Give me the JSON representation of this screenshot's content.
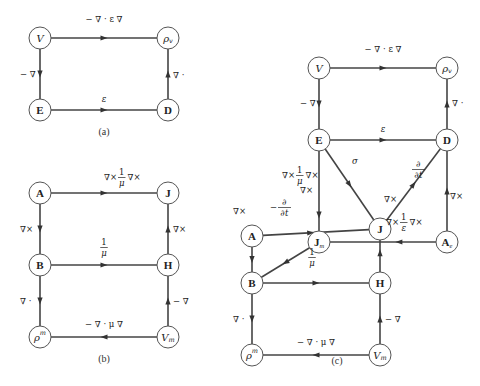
{
  "diagrams": {
    "a": {
      "caption": "(a)",
      "nodes": {
        "V": {
          "label": "V",
          "style": "ital"
        },
        "rho_v": {
          "label": "ρ",
          "sub": "v",
          "style": "ital"
        },
        "E": {
          "label": "E",
          "style": "bold"
        },
        "D": {
          "label": "D",
          "style": "bold"
        }
      },
      "edges": {
        "V_rho": "− ∇ · ε ∇",
        "V_E": "− ∇",
        "E_D": "ε",
        "D_rho": "∇ ·"
      }
    },
    "b": {
      "caption": "(b)",
      "nodes": {
        "A": {
          "label": "A",
          "style": "bold"
        },
        "J": {
          "label": "J",
          "style": "bold"
        },
        "B": {
          "label": "B",
          "style": "bold"
        },
        "H": {
          "label": "H",
          "style": "bold"
        },
        "rho_m": {
          "label": "ρ",
          "sup": "m",
          "style": "ital"
        },
        "V_m": {
          "label": "V",
          "sub": "m",
          "style": "ital"
        }
      },
      "edges": {
        "A_J": {
          "pre": "∇×",
          "num": "1",
          "den": "μ",
          "post": "∇×"
        },
        "A_B": "∇×",
        "B_H": {
          "num": "1",
          "den": "μ"
        },
        "H_J": "∇×",
        "B_rho": "∇ ·",
        "Vm_H": "− ∇",
        "Vm_rho": "− ∇ · μ ∇"
      }
    },
    "c": {
      "caption": "(c)",
      "nodes": {
        "V": {
          "label": "V",
          "style": "ital"
        },
        "rho_v": {
          "label": "ρ",
          "sub": "v",
          "style": "ital"
        },
        "E": {
          "label": "E",
          "style": "bold"
        },
        "D": {
          "label": "D",
          "style": "bold"
        },
        "A": {
          "label": "A",
          "style": "bold"
        },
        "J": {
          "label": "J",
          "style": "bold"
        },
        "Jm": {
          "label": "J",
          "sub": "m",
          "style": "bold"
        },
        "Ae": {
          "label": "A",
          "sub": "e",
          "style": "bold"
        },
        "B": {
          "label": "B",
          "style": "bold"
        },
        "H": {
          "label": "H",
          "style": "bold"
        },
        "rho_m": {
          "label": "ρ",
          "sup": "m",
          "style": "ital"
        },
        "V_m": {
          "label": "V",
          "sub": "m",
          "style": "ital"
        }
      },
      "edges": {
        "V_rho": "− ∇ · ε ∇",
        "V_E": "− ∇",
        "E_D": "ε",
        "D_rho": "∇ ·",
        "E_J": "σ",
        "D_J": {
          "num": "∂",
          "den": "∂t"
        },
        "Ae_D": "∇×",
        "A_J": {
          "pre": "∇×",
          "num": "1",
          "den": "μ",
          "post": "∇×"
        },
        "E_Jm": "∇×",
        "H_J": "∇×",
        "Ae_Jm": {
          "pre": "∇×",
          "num": "1",
          "den": "ε",
          "post": "∇×"
        },
        "A_B": "∇×",
        "Jm_B": {
          "pre": "−",
          "num": "∂",
          "den": "∂t"
        },
        "B_H": {
          "num": "1",
          "den": "μ"
        },
        "B_rho": "∇ ·",
        "Vm_H": "− ∇",
        "Vm_rho": "− ∇ · μ ∇"
      }
    }
  }
}
